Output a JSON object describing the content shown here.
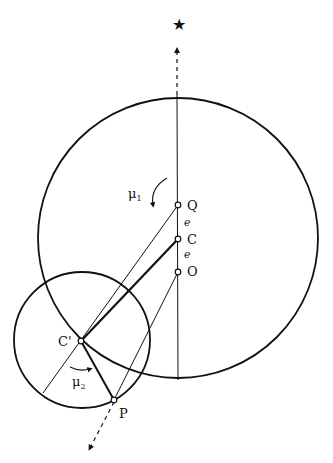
{
  "diagram": {
    "labels": {
      "Q": "Q",
      "C": "C",
      "O": "O",
      "Cprime": "C'",
      "P": "P",
      "e1": "e",
      "e2": "e",
      "mu1": "μ",
      "mu1_sub": "1",
      "mu2": "μ",
      "mu2_sub": "2",
      "star": "★"
    },
    "colors": {
      "stroke": "#111111",
      "background": "#ffffff"
    }
  }
}
